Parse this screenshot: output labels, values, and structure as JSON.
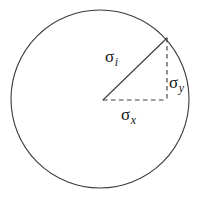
{
  "figure": {
    "background_color": "#ffffff",
    "stroke_color": "#3a3a3a",
    "text_color": "#1a1a1a",
    "width": 202,
    "height": 198
  },
  "circle": {
    "name": "boundary-circle",
    "center_x": 100,
    "center_y": 99,
    "radius": 89,
    "stroke_width": 1.1,
    "style": "solid"
  },
  "vectors": {
    "resultant": {
      "name": "resultant-vector",
      "label_base": "σ",
      "label_sub": "i",
      "style": "solid",
      "from_x": 103,
      "from_y": 100,
      "to_x": 167,
      "to_y": 38
    },
    "horizontal": {
      "name": "x-component",
      "label_base": "σ",
      "label_sub": "x",
      "style": "dashed",
      "from_x": 103,
      "from_y": 100,
      "to_x": 167,
      "to_y": 100
    },
    "vertical": {
      "name": "y-component",
      "label_base": "σ",
      "label_sub": "y",
      "style": "dashed",
      "from_x": 167,
      "from_y": 38,
      "to_x": 167,
      "to_y": 100
    }
  },
  "labels": {
    "sigma_i": {
      "base": "σ",
      "sub": "i"
    },
    "sigma_y": {
      "base": "σ",
      "sub": "y"
    },
    "sigma_x": {
      "base": "σ",
      "sub": "x"
    }
  }
}
